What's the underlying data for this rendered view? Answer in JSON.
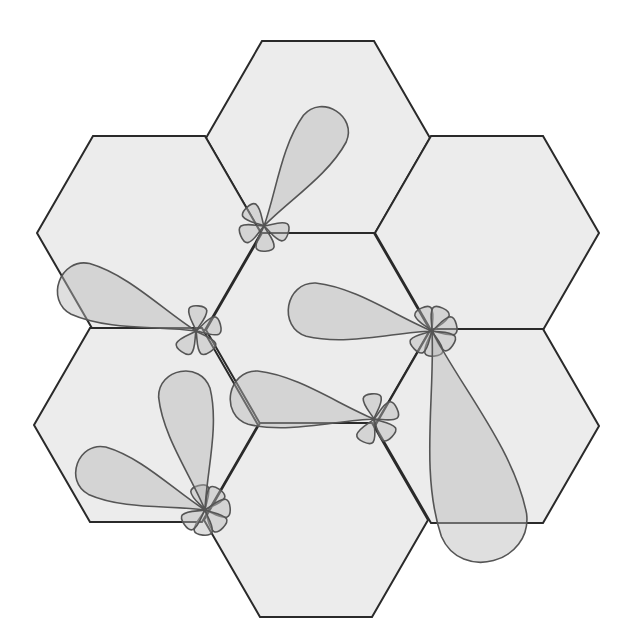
{
  "diagram": {
    "title": "Hexagonal cell layout with 3-sector antenna radiation patterns",
    "type": "cellular-hex-grid",
    "colors": {
      "background": "#ffffff",
      "cell_fill": "#ececec",
      "cell_stroke": "#2a2a2a",
      "lobe_fill": "#b8b8b8",
      "lobe_stroke": "#555555"
    },
    "cells": [
      {
        "id": "top",
        "center": [
          318,
          138
        ],
        "radius": 112
      },
      {
        "id": "upper-left",
        "center": [
          149,
          233
        ],
        "radius": 112
      },
      {
        "id": "upper-right",
        "center": [
          487,
          233
        ],
        "radius": 112
      },
      {
        "id": "center",
        "center": [
          318,
          330
        ],
        "radius": 112
      },
      {
        "id": "lower-left",
        "center": [
          146,
          425
        ],
        "radius": 112
      },
      {
        "id": "lower-right",
        "center": [
          487,
          426
        ],
        "radius": 112
      },
      {
        "id": "bottom",
        "center": [
          316,
          520
        ],
        "radius": 112
      }
    ],
    "antennas": [
      {
        "id": "site-a",
        "position": [
          264,
          226
        ],
        "main_lobe_angle": -58,
        "main_lobe_length": 140,
        "side_lobes": 4
      },
      {
        "id": "site-b",
        "position": [
          196,
          331
        ],
        "main_lobe_angle": 200,
        "main_lobe_length": 150,
        "side_lobes": 4
      },
      {
        "id": "site-c",
        "position": [
          432,
          331
        ],
        "main_lobe_angle": 190,
        "main_lobe_length": 150,
        "side_lobes": 6
      },
      {
        "id": "site-c2",
        "position": [
          432,
          331
        ],
        "main_lobe_angle": 75,
        "main_lobe_length": 245,
        "side_lobes": 0
      },
      {
        "id": "site-d",
        "position": [
          374,
          419
        ],
        "main_lobe_angle": 190,
        "main_lobe_length": 150,
        "side_lobes": 4
      },
      {
        "id": "site-e",
        "position": [
          205,
          510
        ],
        "main_lobe_angle": 200,
        "main_lobe_length": 140,
        "side_lobes": 6
      },
      {
        "id": "site-e2",
        "position": [
          205,
          510
        ],
        "main_lobe_angle": 260,
        "main_lobe_length": 145,
        "side_lobes": 0
      }
    ]
  }
}
